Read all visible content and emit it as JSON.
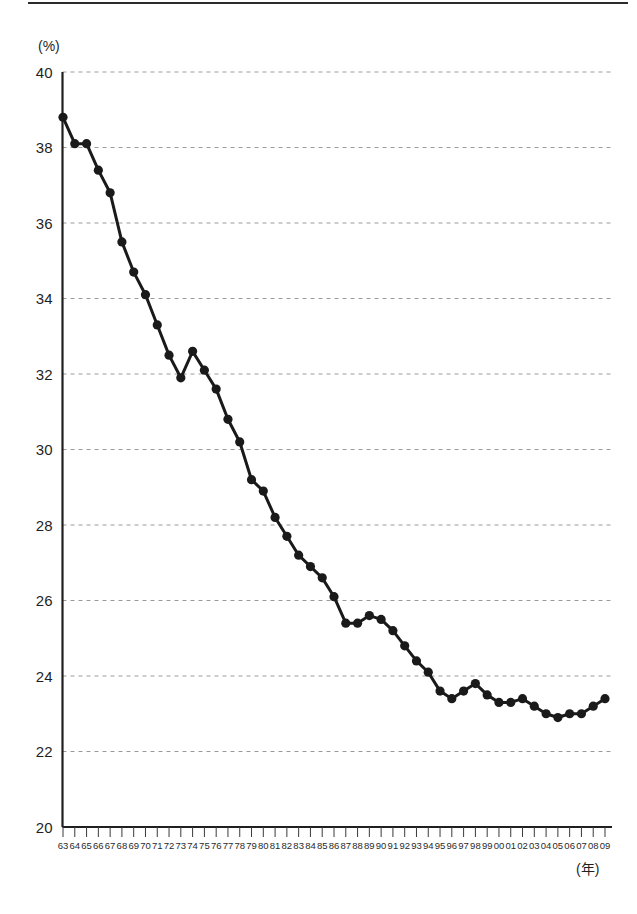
{
  "chart_data": {
    "type": "line",
    "title": "",
    "xlabel": "(年)",
    "ylabel": "(%)",
    "ylim": [
      20,
      40
    ],
    "ytick_step": 2,
    "yticks": [
      40,
      38,
      36,
      34,
      32,
      30,
      28,
      26,
      24,
      22,
      20
    ],
    "grid": true,
    "grid_axis": "y",
    "grid_style": "dashed",
    "grid_color": "#9a9a9a",
    "legend": null,
    "line_color": "#1a1a1a",
    "marker": "circle",
    "marker_color": "#1a1a1a",
    "categories": [
      "63",
      "64",
      "65",
      "66",
      "67",
      "68",
      "69",
      "70",
      "71",
      "72",
      "73",
      "74",
      "75",
      "76",
      "77",
      "78",
      "79",
      "80",
      "81",
      "82",
      "83",
      "84",
      "85",
      "86",
      "87",
      "88",
      "89",
      "90",
      "91",
      "92",
      "93",
      "94",
      "95",
      "96",
      "97",
      "98",
      "99",
      "00",
      "01",
      "02",
      "03",
      "04",
      "05",
      "06",
      "07",
      "08",
      "09"
    ],
    "values": [
      38.8,
      38.1,
      38.1,
      37.4,
      36.8,
      35.5,
      34.7,
      34.1,
      33.3,
      32.5,
      31.9,
      32.6,
      32.1,
      31.6,
      30.8,
      30.2,
      29.2,
      28.9,
      28.2,
      27.7,
      27.2,
      26.9,
      26.6,
      26.1,
      25.4,
      25.4,
      25.6,
      25.5,
      25.2,
      24.8,
      24.4,
      24.1,
      23.6,
      23.4,
      23.6,
      23.8,
      23.5,
      23.3,
      23.3,
      23.4,
      23.2,
      23.0,
      22.9,
      23.0,
      23.0,
      23.2,
      23.4
    ]
  }
}
